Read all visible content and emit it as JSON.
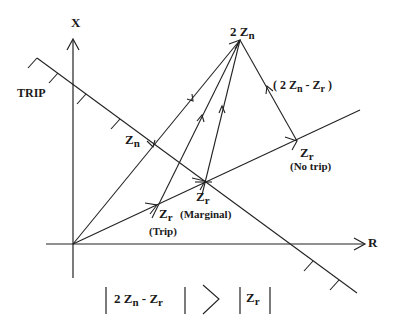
{
  "diagram": {
    "axes": {
      "x_label": "X",
      "r_label": "R"
    },
    "trip_label": "TRIP",
    "points": {
      "two_zn": {
        "main": "2 Z",
        "sub": "n"
      },
      "zn": {
        "main": "Z",
        "sub": "n"
      },
      "zr_no_trip": {
        "main": "Z",
        "sub": "r",
        "caption": "(No trip)"
      },
      "zr_marginal": {
        "main": "Z",
        "sub": "r",
        "caption": "(Marginal)"
      },
      "zr_trip": {
        "main": "Z",
        "sub": "r",
        "caption": "(Trip)"
      }
    },
    "difference_label": {
      "open": "( 2 Z",
      "sub_n": "n",
      "minus": " - Z",
      "sub_r": "r",
      "close": " )"
    },
    "formula": {
      "lhs_main": "2 Z",
      "lhs_sub_n": "n",
      "lhs_minus": " -  Z",
      "lhs_sub_r": "r",
      "relation": ">",
      "rhs_main": "Z",
      "rhs_sub": "r"
    }
  }
}
